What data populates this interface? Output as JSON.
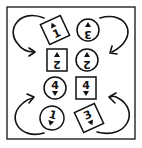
{
  "diagram": {
    "tokens": [
      {
        "id": "top-left",
        "shape": "square",
        "label": "1",
        "arrow": "up",
        "orientation": "tilted"
      },
      {
        "id": "top-right",
        "shape": "circle",
        "label": "3",
        "arrow": "up",
        "orientation": "upside-down"
      },
      {
        "id": "row2-left",
        "shape": "square",
        "label": "2",
        "arrow": "up",
        "orientation": "upside-down"
      },
      {
        "id": "row2-right",
        "shape": "circle",
        "label": "2",
        "arrow": "up",
        "orientation": "upside-down"
      },
      {
        "id": "row3-left",
        "shape": "circle",
        "label": "4",
        "arrow": "down",
        "orientation": "upright"
      },
      {
        "id": "row3-right",
        "shape": "square",
        "label": "4",
        "arrow": "down",
        "orientation": "upright"
      },
      {
        "id": "bottom-left",
        "shape": "circle",
        "label": "1",
        "arrow": "down",
        "orientation": "tilted"
      },
      {
        "id": "bottom-right",
        "shape": "square",
        "label": "3",
        "arrow": "down",
        "orientation": "tilted"
      }
    ],
    "connectors": [
      {
        "from": "top-left",
        "to": "row2-left",
        "side": "left"
      },
      {
        "from": "top-right",
        "to": "row2-right",
        "side": "right"
      },
      {
        "from": "bottom-left",
        "to": "row3-left",
        "side": "left"
      },
      {
        "from": "bottom-right",
        "to": "row3-right",
        "side": "right"
      }
    ],
    "colors": {
      "ink": "#111111",
      "background": "#ffffff"
    }
  }
}
